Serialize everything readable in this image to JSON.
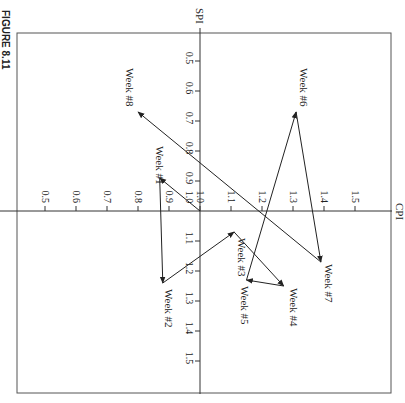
{
  "figure": {
    "label": "FIGURE 8.11"
  },
  "chart_data": {
    "type": "line",
    "title": "",
    "xlabel": "CPI",
    "ylabel": "SPI",
    "orientation_note": "figure rotated 90 degrees clockwise on page",
    "xlim": [
      0.5,
      1.5
    ],
    "ylim": [
      0.5,
      1.5
    ],
    "x_ticks": [
      "0.5",
      "0.6",
      "0.7",
      "0.8",
      "0.9",
      "1.0",
      "1.1",
      "1.2",
      "1.3",
      "1.4",
      "1.5"
    ],
    "y_ticks": [
      "0.5",
      "0.6",
      "0.7",
      "0.8",
      "0.9",
      "1.0",
      "1.1",
      "1.2",
      "1.3",
      "1.4",
      "1.5"
    ],
    "grid": false,
    "legend": null,
    "origin": {
      "cpi": 1.0,
      "spi": 1.0
    },
    "series": [
      {
        "name": "Weekly CPI/SPI path",
        "points": [
          {
            "label": "Week #1",
            "cpi": 0.87,
            "spi": 0.89
          },
          {
            "label": "Week #2",
            "cpi": 0.88,
            "spi": 1.24
          },
          {
            "label": "Week #3",
            "cpi": 1.11,
            "spi": 1.07
          },
          {
            "label": "Week #4",
            "cpi": 1.27,
            "spi": 1.25
          },
          {
            "label": "Week #5",
            "cpi": 1.15,
            "spi": 1.23
          },
          {
            "label": "Week #6",
            "cpi": 1.31,
            "spi": 0.67
          },
          {
            "label": "Week #7",
            "cpi": 1.39,
            "spi": 1.17
          },
          {
            "label": "Week #8",
            "cpi": 0.8,
            "spi": 0.67
          }
        ]
      }
    ]
  },
  "colors": {
    "line": "#222222",
    "frame": "#555555",
    "axis": "#333333",
    "background": "#ffffff"
  }
}
